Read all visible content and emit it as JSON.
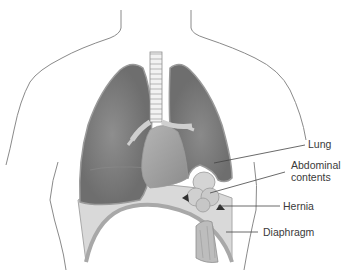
{
  "diagram": {
    "labels": [
      {
        "id": "lung",
        "text": "Lung"
      },
      {
        "id": "abdominal",
        "text": "Abdominal contents",
        "lines": [
          "Abdominal",
          "contents"
        ]
      },
      {
        "id": "hernia",
        "text": "Hernia"
      },
      {
        "id": "diaphragm",
        "text": "Diaphragm"
      }
    ],
    "colors": {
      "lung_fill": "#6e6e6e",
      "lung_outline": "#9a9a9a",
      "diaphragm_fill": "#d9d9d9",
      "diaphragm_edge": "#a8a8a8",
      "organ_fill": "#cfcfcf",
      "trachea_fill": "#e8e8e8",
      "body_outline": "#8a8a8a",
      "leader_line": "#444444",
      "text": "#3a3a3a"
    }
  }
}
